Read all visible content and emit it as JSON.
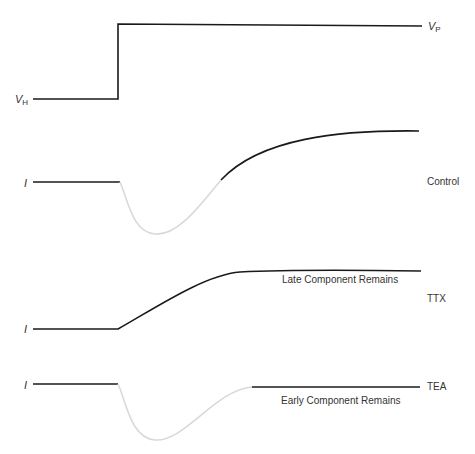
{
  "diagram": {
    "voltage_trace": {
      "holding_label": "V",
      "holding_subscript": "H",
      "pulse_label": "V",
      "pulse_subscript": "P"
    },
    "traces": [
      {
        "id": "control",
        "current_label": "I",
        "condition_label": "Control",
        "annotation": ""
      },
      {
        "id": "ttx",
        "current_label": "I",
        "condition_label": "TTX",
        "annotation": "Late Component Remains"
      },
      {
        "id": "tea",
        "current_label": "I",
        "condition_label": "TEA",
        "annotation": "Early Component Remains"
      }
    ],
    "colors": {
      "trace_black": "#1a1a1a",
      "trace_gray": "#d9d9d9",
      "text": "#333333"
    }
  }
}
